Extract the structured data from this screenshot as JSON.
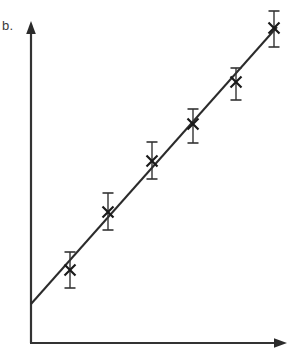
{
  "figure": {
    "panel_label": "b.",
    "width": 292,
    "height": 355,
    "background_color": "#ffffff",
    "ink_color": "#333333",
    "marker_color": "#1a1a1a"
  },
  "chart_data": {
    "type": "scatter",
    "title": "b.",
    "xlabel": "",
    "ylabel": "",
    "grid": false,
    "legend": null,
    "axes": {
      "x_axis": {
        "arrow": true,
        "label_ticks": false,
        "origin_px": 31,
        "end_px": 287,
        "baseline_px": 343
      },
      "y_axis": {
        "arrow": true,
        "label_ticks": false,
        "origin_px": 343,
        "end_px": 22,
        "baseline_px": 31
      },
      "xlim": [
        0,
        7
      ],
      "ylim": [
        0,
        7
      ]
    },
    "series": [
      {
        "name": "measurements",
        "marker": "x",
        "x": [
          1,
          2,
          3,
          4,
          5,
          6
        ],
        "y": [
          1.15,
          2.27,
          3.32,
          4.17,
          5.18,
          6.24
        ],
        "yerr_lower": [
          0.39,
          0.38,
          0.38,
          0.31,
          0.29,
          0.36
        ],
        "yerr_upper": [
          0.39,
          0.38,
          0.38,
          0.31,
          0.29,
          0.36
        ],
        "points_px": [
          {
            "cx": 70,
            "cy": 270,
            "err_top": 252,
            "err_bottom": 288
          },
          {
            "cx": 108,
            "cy": 212,
            "err_top": 193,
            "err_bottom": 230
          },
          {
            "cx": 152,
            "cy": 161,
            "err_top": 142,
            "err_bottom": 179
          },
          {
            "cx": 193,
            "cy": 124,
            "err_top": 109,
            "err_bottom": 143
          },
          {
            "cx": 236,
            "cy": 82,
            "err_top": 68,
            "err_bottom": 100
          },
          {
            "cx": 274,
            "cy": 28,
            "err_top": 11,
            "err_bottom": 47
          }
        ],
        "marker_size_px": 11,
        "errorbar_cap_width_px": 11
      }
    ],
    "fit_line": {
      "name": "linear-fit",
      "x0_px": 31,
      "y0_px": 304,
      "x1_px": 277,
      "y1_px": 27,
      "stroke_width_px": 2
    }
  }
}
